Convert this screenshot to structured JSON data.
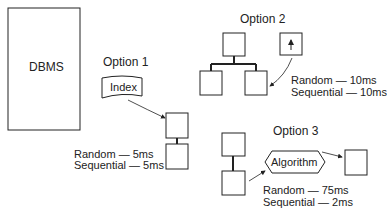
{
  "dbms": {
    "label": "DBMS"
  },
  "option1": {
    "title": "Option 1",
    "component": "Index",
    "random": "Random — 5ms",
    "sequential": "Sequential — 5ms"
  },
  "option2": {
    "title": "Option 2",
    "random": "Random — 10ms",
    "sequential": "Sequential — 10ms"
  },
  "option3": {
    "title": "Option 3",
    "component": "Algorithm",
    "random": "Random — 75ms",
    "sequential": "Sequential — 2ms"
  },
  "colors": {
    "stroke": "#222222",
    "background": "#ffffff"
  }
}
